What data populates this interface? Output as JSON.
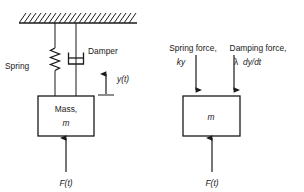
{
  "figure": {
    "stroke_color": "#1a1a1a",
    "background_color": "#ffffff"
  },
  "left_diagram": {
    "name": "spring-mass-damper-schematic",
    "ceiling": {
      "name": "fixed-support-hatching",
      "hatch_count": 23
    },
    "spring_label": "Spring",
    "damper_label": "Damper",
    "displacement_label": "y(t)",
    "mass_label_line1": "Mass,",
    "mass_label_line2": "m",
    "force_label": "F(t)"
  },
  "right_diagram": {
    "name": "free-body-diagram",
    "spring_force_label_line1": "Spring force,",
    "spring_force_label_line2": "ky",
    "damping_force_label_line1": "Damping force,",
    "damping_force_label_line2_symbol": "λ",
    "damping_force_label_line2_expr": "dy/dt",
    "mass_label": "m",
    "force_label": "F(t)"
  }
}
